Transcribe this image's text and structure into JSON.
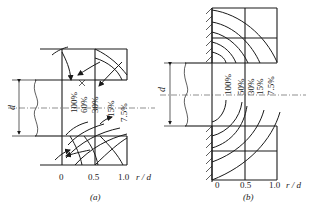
{
  "figure": {
    "panels": [
      {
        "id": "a",
        "caption": "(a)",
        "dimension_label": "d",
        "axis": {
          "ticks": [
            "0",
            "0.5",
            "1.0"
          ],
          "label": "r / d"
        },
        "contour_labels": [
          "100%",
          "60%",
          "30%",
          "15%",
          "7.5%"
        ]
      },
      {
        "id": "b",
        "caption": "(b)",
        "dimension_label": "d",
        "axis": {
          "ticks": [
            "0",
            "0.5",
            "1.0"
          ],
          "label": "r / d"
        },
        "contour_labels": [
          "100%",
          "50%",
          "30%",
          "15%",
          "7.5%"
        ]
      }
    ]
  }
}
